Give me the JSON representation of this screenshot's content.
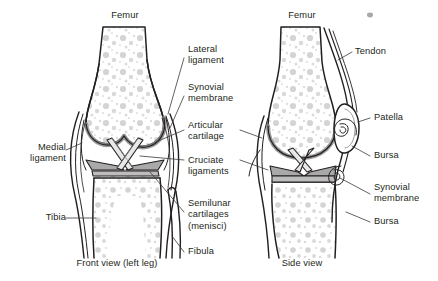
{
  "diagram": {
    "title_front": "Femur",
    "title_side": "Femur",
    "caption_front": "Front view (left leg)",
    "caption_side": "Side view",
    "colors": {
      "outline": "#231f20",
      "spongy_bone": "#d4d4d4",
      "cartilage": "#a9a9a9",
      "membrane": "#bdbdbd",
      "leader_line": "#3a3a3a",
      "background": "#ffffff"
    },
    "labels_left": [
      {
        "id": "medial-ligament",
        "text": "Medial\nligament"
      },
      {
        "id": "tibia",
        "text": "Tibia"
      }
    ],
    "labels_center": [
      {
        "id": "lateral-ligament",
        "text": "Lateral\nligament"
      },
      {
        "id": "synovial-membrane",
        "text": "Synovial\nmembrane"
      },
      {
        "id": "articular-cartilage",
        "text": "Articular\ncartilage"
      },
      {
        "id": "cruciate-ligaments",
        "text": "Cruciate\nligaments"
      },
      {
        "id": "semilunar-cartilages",
        "text": "Semilunar\ncartilages\n(menisci)"
      },
      {
        "id": "fibula",
        "text": "Fibula"
      }
    ],
    "labels_right": [
      {
        "id": "tendon",
        "text": "Tendon"
      },
      {
        "id": "patella",
        "text": "Patella"
      },
      {
        "id": "bursa-upper",
        "text": "Bursa"
      },
      {
        "id": "synovial-membrane-side",
        "text": "Synovial\nmembrane"
      },
      {
        "id": "bursa-lower",
        "text": "Bursa"
      }
    ]
  }
}
